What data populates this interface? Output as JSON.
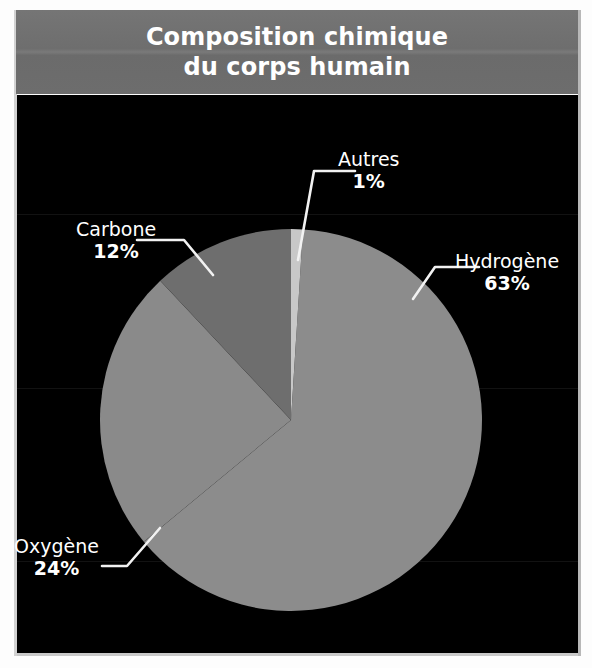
{
  "title": {
    "line1": "Composition chimique",
    "line2": "du corps humain"
  },
  "colors": {
    "background": "#000000",
    "header_band": "#6f6f6f",
    "page": "#ffffff",
    "label_text": "#ffffff",
    "leader_line": "#f2f2f2",
    "slice_hydrogene": "#8c8c8c",
    "slice_oxygene": "#8a8a8a",
    "slice_carbone": "#6e6e6e",
    "slice_autres": "#c8c8c8"
  },
  "labels": {
    "autres": {
      "name": "Autres",
      "pct": "1%"
    },
    "carbone": {
      "name": "Carbone",
      "pct": "12%"
    },
    "hydrogene": {
      "name": "Hydrogène",
      "pct": "63%"
    },
    "oxygene": {
      "name": "Oxygène",
      "pct": "24%"
    }
  },
  "chart_data": {
    "type": "pie",
    "title": "Composition chimique du corps humain",
    "subtitle": "",
    "xlabel": "",
    "ylabel": "",
    "grid": false,
    "legend_position": "callout-labels",
    "units": "%",
    "start_angle_deg": -90,
    "direction": "clockwise",
    "center_px": [
      291,
      420
    ],
    "radius_px": 191,
    "categories": [
      "Autres",
      "Hydrogène",
      "Oxygène",
      "Carbone"
    ],
    "values": [
      1,
      63,
      24,
      12
    ],
    "slices": [
      {
        "label": "Autres",
        "value": 1,
        "display": "1%",
        "color": "#c8c8c8",
        "start_deg": -90.0,
        "end_deg": -86.4
      },
      {
        "label": "Hydrogène",
        "value": 63,
        "display": "63%",
        "color": "#8c8c8c",
        "start_deg": -86.4,
        "end_deg": 140.4
      },
      {
        "label": "Oxygène",
        "value": 24,
        "display": "24%",
        "color": "#8a8a8a",
        "start_deg": 140.4,
        "end_deg": 226.8
      },
      {
        "label": "Carbone",
        "value": 12,
        "display": "12%",
        "color": "#6e6e6e",
        "start_deg": 226.8,
        "end_deg": 270.0
      }
    ],
    "annotations": [
      {
        "text": "Autres 1%",
        "target": "Autres"
      },
      {
        "text": "Carbone 12%",
        "target": "Carbone"
      },
      {
        "text": "Hydrogène 63%",
        "target": "Hydrogène"
      },
      {
        "text": "Oxygène 24%",
        "target": "Oxygène"
      }
    ]
  }
}
